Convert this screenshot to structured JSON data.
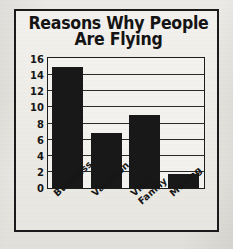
{
  "figure": {
    "title_line1": "Reasons Why People",
    "title_line2": "Are Flying",
    "frame_color": "#1b1b1b",
    "paper_color": "#ece9e5",
    "bar_color": "#181818"
  },
  "chart_data": {
    "type": "bar",
    "title": "Reasons Why People Are Flying",
    "xlabel": "",
    "ylabel": "",
    "categories": [
      "Business",
      "Vacation",
      "Visit Family",
      "Moving"
    ],
    "category_lines": [
      [
        "Business"
      ],
      [
        "Vacation"
      ],
      [
        "Visit",
        "Family"
      ],
      [
        "Moving"
      ]
    ],
    "values": [
      15,
      6.8,
      9,
      1.8
    ],
    "ylim": [
      0,
      16
    ],
    "yticks": [
      0,
      2,
      4,
      6,
      8,
      10,
      12,
      14,
      16
    ],
    "ytick_labels": [
      "0",
      "2",
      "4",
      "6",
      "8",
      "10",
      "12",
      "14",
      "16"
    ],
    "grid": true,
    "grid_axis": "y",
    "legend": false,
    "legend_position": "none"
  }
}
